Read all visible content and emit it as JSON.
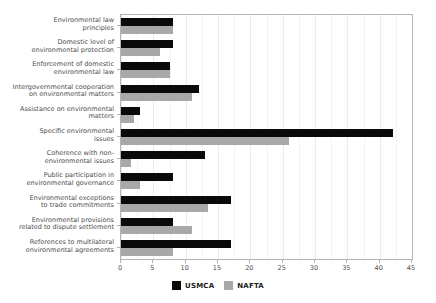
{
  "chart_data": {
    "type": "bar",
    "orientation": "horizontal",
    "title": "",
    "xlabel": "",
    "ylabel": "",
    "xlim": [
      0,
      45
    ],
    "xticks": [
      0,
      5,
      10,
      15,
      20,
      25,
      30,
      35,
      40,
      45
    ],
    "grid": true,
    "legend_position": "bottom",
    "categories": [
      "Environmental law principles",
      "Domestic level of environmental protection",
      "Enforcement of domestic environmental law",
      "Intergovernmental cooperation on environmental matters",
      "Assistance on environmental matters",
      "Specific environmental issues",
      "Coherence with non-environmental issues",
      "Public participation in environmental governance",
      "Environmental exceptions to trade commitments",
      "Environmental provisions related to dispute settlement",
      "References to multilateral environmental agreements"
    ],
    "category_lines": [
      [
        "Environmental law",
        "principles"
      ],
      [
        "Domestic level of",
        "environmental protection"
      ],
      [
        "Enforcement of domestic",
        "environmental law"
      ],
      [
        "Intergovernmental cooperation",
        "on environmental matters"
      ],
      [
        "Assistance on environmental",
        "matters"
      ],
      [
        "Specific environmental",
        "issues"
      ],
      [
        "Coherence with non-",
        "environmental issues"
      ],
      [
        "Public participation in",
        "environmental governance"
      ],
      [
        "Environmental exceptions",
        "to trade commitments"
      ],
      [
        "Environmental provisions",
        "related to dispute settlement"
      ],
      [
        "References to multilateral",
        "environmental agreements"
      ]
    ],
    "series": [
      {
        "name": "USMCA",
        "color": "#0a0a0a",
        "values": [
          8,
          8,
          7.5,
          12,
          3,
          42,
          13,
          8,
          17,
          8,
          17
        ]
      },
      {
        "name": "NAFTA",
        "color": "#a8a8a8",
        "values": [
          8,
          6,
          7.5,
          11,
          2,
          26,
          1.5,
          3,
          13.5,
          11,
          8
        ]
      }
    ]
  },
  "legend": {
    "entries": [
      {
        "label": "USMCA",
        "color": "#0a0a0a"
      },
      {
        "label": "NAFTA",
        "color": "#a8a8a8"
      }
    ]
  }
}
